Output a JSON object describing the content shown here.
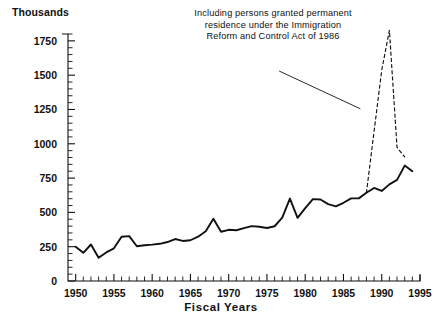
{
  "chart_data": {
    "type": "line",
    "title": "",
    "subtitle": "",
    "unit_label": "Thousands",
    "xlabel": "Fiscal Years",
    "ylabel": "",
    "xlim": [
      1949,
      1995
    ],
    "ylim": [
      0,
      1800
    ],
    "ytick_labels": [
      "0",
      "250",
      "500",
      "750",
      "1000",
      "1250",
      "1500",
      "1750"
    ],
    "ytick_values": [
      0,
      250,
      500,
      750,
      1000,
      1250,
      1500,
      1750
    ],
    "ytick_minor_step": 50,
    "xtick_labels": [
      "1950",
      "1955",
      "1960",
      "1965",
      "1970",
      "1975",
      "1980",
      "1985",
      "1990",
      "1995"
    ],
    "xtick_values": [
      1950,
      1955,
      1960,
      1965,
      1970,
      1975,
      1980,
      1985,
      1990,
      1995
    ],
    "xtick_minor_step": 1,
    "grid": false,
    "legend_position": "none",
    "annotations": [
      {
        "text": "Including persons granted permanent\nresidence under the Immigration\nReform and Control Act of 1986",
        "leader_line": {
          "x1": 1976.6,
          "y1": 1530,
          "x2": 1987.2,
          "y2": 1255
        }
      }
    ],
    "series": [
      {
        "name": "Immigrants admitted (excluding IRCA legalizations)",
        "style": "solid",
        "color": "#111111",
        "x": [
          1950,
          1951,
          1952,
          1953,
          1954,
          1955,
          1956,
          1957,
          1958,
          1959,
          1960,
          1961,
          1962,
          1963,
          1964,
          1965,
          1966,
          1967,
          1968,
          1969,
          1970,
          1971,
          1972,
          1973,
          1974,
          1975,
          1976,
          1977,
          1978,
          1979,
          1980,
          1981,
          1982,
          1983,
          1984,
          1985,
          1986,
          1987,
          1988,
          1989,
          1990,
          1991,
          1992,
          1993,
          1994
        ],
        "values": [
          249,
          205,
          266,
          170,
          208,
          238,
          322,
          327,
          253,
          261,
          265,
          271,
          284,
          306,
          292,
          297,
          323,
          362,
          454,
          359,
          373,
          370,
          385,
          400,
          395,
          386,
          399,
          462,
          601,
          460,
          531,
          597,
          594,
          560,
          544,
          570,
          602,
          602,
          643,
          678,
          656,
          704,
          737,
          841,
          800
        ]
      },
      {
        "name": "Total including IRCA legalizations",
        "style": "dashed",
        "color": "#111111",
        "x": [
          1988,
          1989,
          1990,
          1991,
          1992,
          1993
        ],
        "values": [
          643,
          1091,
          1536,
          1827,
          974,
          904
        ]
      }
    ]
  }
}
